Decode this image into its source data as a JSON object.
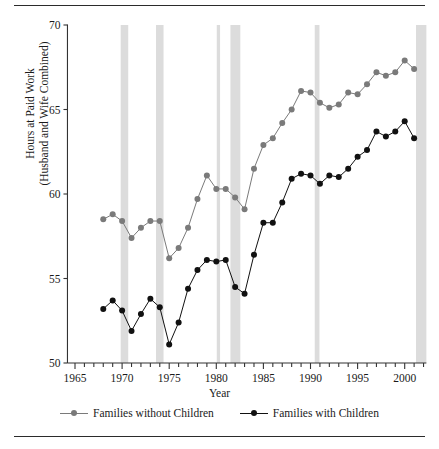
{
  "chart_data": {
    "type": "line",
    "title": "",
    "xlabel": "Year",
    "ylabel": "Hours at Paid Work\n(Husband and Wife Combined)",
    "xlim": [
      1964.2,
      1965.0
    ],
    "x_axis": {
      "min": 1964.2,
      "max": 2002.3,
      "ticks_major": [
        1965,
        1970,
        1975,
        1980,
        1985,
        1990,
        1995,
        2000
      ],
      "tick_labels": [
        "1965",
        "1970",
        "1975",
        "1980",
        "1985",
        "1990",
        "1995",
        "2000"
      ],
      "tick_minor_step": 1
    },
    "y_axis": {
      "min": 50,
      "max": 70,
      "ticks": [
        50,
        55,
        60,
        65,
        70
      ],
      "tick_labels": [
        "50",
        "55",
        "60",
        "65",
        "70"
      ]
    },
    "grid": false,
    "legend_position": "bottom",
    "colors": {
      "series_without_children": "#7a7a7a",
      "series_with_children": "#111111",
      "recession_band": "#dcdcdc",
      "axis": "#333333",
      "rule": "#2b2b2b"
    },
    "recession_bands": [
      {
        "start": 1969.85,
        "end": 1970.65
      },
      {
        "start": 1973.6,
        "end": 1974.4
      },
      {
        "start": 1980.05,
        "end": 1980.4
      },
      {
        "start": 1981.5,
        "end": 1982.55
      },
      {
        "start": 1990.45,
        "end": 1990.95
      },
      {
        "start": 2001.2,
        "end": 2002.3
      }
    ],
    "x": [
      1968,
      1969,
      1970,
      1971,
      1972,
      1973,
      1974,
      1975,
      1976,
      1977,
      1978,
      1979,
      1980,
      1981,
      1982,
      1983,
      1984,
      1985,
      1986,
      1987,
      1988,
      1989,
      1990,
      1991,
      1992,
      1993,
      1994,
      1995,
      1996,
      1997,
      1998,
      1999,
      2000,
      2001
    ],
    "series": [
      {
        "name": "Families without Children",
        "color": "#7a7a7a",
        "values": [
          58.5,
          58.8,
          58.4,
          57.4,
          58.0,
          58.4,
          58.4,
          56.2,
          56.8,
          58.0,
          59.7,
          61.1,
          60.3,
          60.3,
          59.8,
          59.1,
          61.5,
          62.9,
          63.3,
          64.2,
          65.0,
          66.1,
          66.0,
          65.4,
          65.1,
          65.3,
          66.0,
          65.9,
          66.5,
          67.2,
          67.0,
          67.2,
          67.9,
          67.4
        ]
      },
      {
        "name": "Families with Children",
        "color": "#111111",
        "values": [
          53.2,
          53.7,
          53.1,
          51.9,
          52.9,
          53.8,
          53.3,
          51.1,
          52.4,
          54.4,
          55.5,
          56.1,
          56.0,
          56.1,
          54.5,
          54.1,
          56.4,
          58.3,
          58.3,
          59.5,
          60.9,
          61.2,
          61.1,
          60.6,
          61.1,
          61.0,
          61.5,
          62.2,
          62.6,
          63.7,
          63.4,
          63.7,
          64.3,
          63.3
        ]
      }
    ]
  },
  "legend": {
    "entries": [
      {
        "label": "Families without Children"
      },
      {
        "label": "Families with Children"
      }
    ]
  },
  "axis_titles": {
    "x": "Year",
    "y": "Hours at Paid Work\n(Husband and Wife Combined)"
  }
}
